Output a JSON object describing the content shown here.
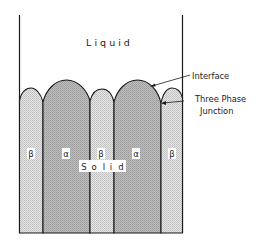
{
  "diagram": {
    "liquid_label": "L i q u i d",
    "solid_label_chars": [
      "S",
      "o",
      "l",
      "i",
      "d"
    ],
    "phases": [
      {
        "label": "β",
        "kind": "beta"
      },
      {
        "label": "α",
        "kind": "alpha"
      },
      {
        "label": "β",
        "kind": "beta"
      },
      {
        "label": "α",
        "kind": "alpha"
      },
      {
        "label": "β",
        "kind": "beta"
      }
    ],
    "annotations": {
      "interface": "Interface",
      "three_phase_line1": "Three Phase",
      "three_phase_line2": "Junction"
    },
    "colors": {
      "alpha_fill": "#b4b4b4",
      "beta_fill": "#dcdcdc",
      "outline": "#1a1a1a"
    }
  }
}
